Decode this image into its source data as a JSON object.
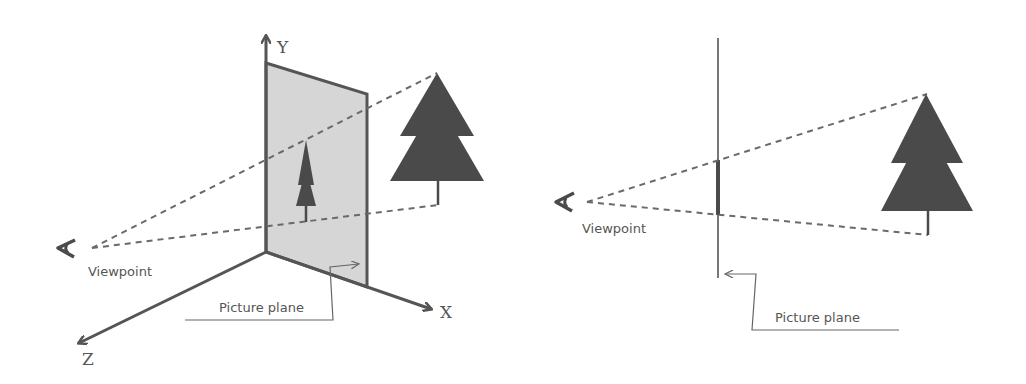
{
  "left_diagram": {
    "axes": {
      "x_label": "X",
      "y_label": "Y",
      "z_label": "Z"
    },
    "viewpoint_label": "Viewpoint",
    "picture_plane_label": "Picture plane",
    "plane_fill": "#d6d6d6"
  },
  "right_diagram": {
    "viewpoint_label": "Viewpoint",
    "picture_plane_label": "Picture plane"
  },
  "colors": {
    "line": "#555555",
    "tree": "#4a4a4a",
    "dash": "#6a6a6a"
  }
}
